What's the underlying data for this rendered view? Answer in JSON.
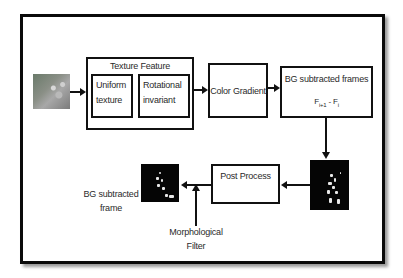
{
  "diagram": {
    "nodes": {
      "input_image": {
        "label": "",
        "kind": "image"
      },
      "texture_feature": {
        "title": "Texture Feature",
        "children": [
          {
            "line1": "Uniform",
            "line2": "texture"
          },
          {
            "line1": "Rotational",
            "line2": "invariant"
          }
        ]
      },
      "color_gradient": {
        "label": "Color Gradient"
      },
      "bg_subtracted_frames": {
        "title": "BG subtracted frames",
        "formula_f1": "F",
        "formula_sub1": "i+1",
        "formula_op": " - ",
        "formula_f2": "F",
        "formula_sub2": "i"
      },
      "subtracted_image": {
        "label": "",
        "kind": "image"
      },
      "post_process": {
        "label": "Post Process"
      },
      "output_image": {
        "label": "",
        "kind": "image"
      },
      "output_label": {
        "line1": "BG subtracted",
        "line2": "frame"
      },
      "morphological_filter": {
        "line1": "Morphological",
        "line2": "Filter"
      }
    },
    "edges": [
      {
        "from": "input_image",
        "to": "texture_feature"
      },
      {
        "from": "texture_feature",
        "to": "color_gradient"
      },
      {
        "from": "color_gradient",
        "to": "bg_subtracted_frames"
      },
      {
        "from": "bg_subtracted_frames",
        "to": "subtracted_image"
      },
      {
        "from": "subtracted_image",
        "to": "post_process"
      },
      {
        "from": "post_process",
        "to": "output_image"
      },
      {
        "from": "morphological_filter",
        "to": "post_process_output_edge"
      }
    ],
    "colors": {
      "stroke": "#111111",
      "background": "#ffffff",
      "text": "#2a2a2a",
      "image_dark": "#050505"
    }
  }
}
